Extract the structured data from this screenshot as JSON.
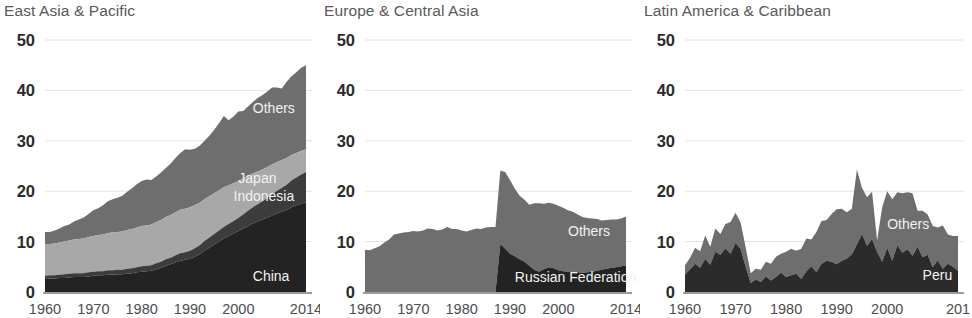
{
  "figure": {
    "background": "#ffffff",
    "width": 958,
    "height": 318
  },
  "palette": {
    "band_dark": "#232323",
    "band_dark_medium": "#3c3c3c",
    "band_light": "#a8a8a8",
    "band_medium": "#6e6e6e",
    "gridline": "#e2e2e2",
    "axis": "#7a7a7a",
    "title_text": "#595959",
    "ytick_text": "#2b2b2b",
    "xtick_text": "#4d4d4d",
    "series_label_text": "#f2f2f2"
  },
  "chart_data": [
    {
      "type": "area",
      "title": "East Asia & Pacific",
      "xlabel": "",
      "ylabel": "",
      "xlim": [
        1960,
        2014
      ],
      "ylim": [
        0,
        50
      ],
      "grid": true,
      "stacked": true,
      "legend_position": "inline-annotation",
      "ytick_values": [
        0,
        10,
        20,
        30,
        40,
        50
      ],
      "ytick_labels": [
        "0",
        "10",
        "20",
        "30",
        "40",
        "50"
      ],
      "xtick_values": [
        1960,
        1970,
        1980,
        1990,
        2000,
        2014
      ],
      "xtick_labels": [
        "1960",
        "1970",
        "1980",
        "1990",
        "2000",
        "2014"
      ],
      "x": [
        1960,
        1961,
        1962,
        1963,
        1964,
        1965,
        1966,
        1967,
        1968,
        1969,
        1970,
        1971,
        1972,
        1973,
        1974,
        1975,
        1976,
        1977,
        1978,
        1979,
        1980,
        1981,
        1982,
        1983,
        1984,
        1985,
        1986,
        1987,
        1988,
        1989,
        1990,
        1991,
        1992,
        1993,
        1994,
        1995,
        1996,
        1997,
        1998,
        1999,
        2000,
        2001,
        2002,
        2003,
        2004,
        2005,
        2006,
        2007,
        2008,
        2009,
        2010,
        2011,
        2012,
        2013,
        2014
      ],
      "series": [
        {
          "name": "China",
          "color": "#232323",
          "values": [
            2.6,
            2.7,
            2.7,
            2.8,
            2.8,
            2.9,
            3.0,
            3.0,
            3.0,
            3.1,
            3.2,
            3.3,
            3.3,
            3.4,
            3.4,
            3.5,
            3.5,
            3.6,
            3.7,
            3.9,
            4.0,
            4.1,
            4.2,
            4.5,
            4.8,
            5.2,
            5.5,
            5.9,
            6.2,
            6.4,
            6.6,
            7.0,
            7.5,
            8.2,
            8.8,
            9.4,
            10.0,
            10.6,
            11.1,
            11.6,
            12.1,
            12.6,
            13.1,
            13.6,
            14.0,
            14.4,
            14.8,
            15.2,
            15.6,
            15.9,
            16.3,
            16.8,
            17.2,
            17.5,
            17.8
          ]
        },
        {
          "name": "Indonesia",
          "color": "#3c3c3c",
          "values": [
            0.6,
            0.6,
            0.6,
            0.6,
            0.7,
            0.7,
            0.7,
            0.7,
            0.7,
            0.8,
            0.8,
            0.8,
            0.8,
            0.9,
            0.9,
            0.9,
            0.9,
            1.0,
            1.0,
            1.0,
            1.1,
            1.1,
            1.1,
            1.2,
            1.2,
            1.3,
            1.3,
            1.4,
            1.5,
            1.5,
            1.6,
            1.7,
            1.8,
            1.9,
            2.0,
            2.1,
            2.2,
            2.3,
            2.4,
            2.5,
            2.6,
            2.8,
            3.0,
            3.2,
            3.4,
            3.6,
            3.9,
            4.2,
            4.5,
            4.8,
            5.0,
            5.3,
            5.5,
            5.8,
            6.0
          ]
        },
        {
          "name": "Japan",
          "color": "#a8a8a8",
          "values": [
            6.3,
            6.2,
            6.3,
            6.4,
            6.5,
            6.6,
            6.7,
            6.8,
            6.9,
            7.0,
            7.1,
            7.2,
            7.3,
            7.4,
            7.5,
            7.5,
            7.6,
            7.7,
            7.8,
            7.9,
            8.0,
            8.0,
            8.1,
            8.2,
            8.3,
            8.4,
            8.5,
            8.5,
            8.6,
            8.6,
            8.6,
            8.5,
            8.4,
            8.3,
            8.2,
            8.1,
            8.0,
            7.9,
            7.7,
            7.5,
            7.3,
            7.1,
            6.9,
            6.7,
            6.5,
            6.3,
            6.1,
            5.9,
            5.7,
            5.5,
            5.3,
            5.1,
            4.9,
            4.7,
            4.5
          ]
        },
        {
          "name": "Others",
          "color": "#6e6e6e",
          "values": [
            2.4,
            2.4,
            2.6,
            2.8,
            3.1,
            3.2,
            3.6,
            3.9,
            4.2,
            4.6,
            5.1,
            5.3,
            5.8,
            6.3,
            6.6,
            6.8,
            7.1,
            7.6,
            8.1,
            8.6,
            8.9,
            9.1,
            8.8,
            9.0,
            9.4,
            9.7,
            10.2,
            10.8,
            11.3,
            11.8,
            11.4,
            11.2,
            11.3,
            11.6,
            12.0,
            12.6,
            13.3,
            14.1,
            12.9,
            13.2,
            13.8,
            13.4,
            13.8,
            14.2,
            14.6,
            14.8,
            15.0,
            15.3,
            14.8,
            14.2,
            15.1,
            15.6,
            16.0,
            16.5,
            16.7
          ]
        }
      ],
      "annotations": [
        {
          "text": "Others",
          "x": 2003,
          "y": 35.5,
          "anchor": "start"
        },
        {
          "text": "Japan",
          "x": 2000,
          "y": 21.7,
          "anchor": "start"
        },
        {
          "text": "Indonesia",
          "x": 1999,
          "y": 18.1,
          "anchor": "start"
        },
        {
          "text": "China",
          "x": 2003,
          "y": 2.2,
          "anchor": "start"
        }
      ]
    },
    {
      "type": "area",
      "title": "Europe & Central Asia",
      "xlabel": "",
      "ylabel": "",
      "xlim": [
        1960,
        2014
      ],
      "ylim": [
        0,
        50
      ],
      "grid": true,
      "stacked": true,
      "legend_position": "inline-annotation",
      "ytick_values": [
        0,
        10,
        20,
        30,
        40,
        50
      ],
      "ytick_labels": [
        "0",
        "10",
        "20",
        "30",
        "40",
        "50"
      ],
      "xtick_values": [
        1960,
        1970,
        1980,
        1990,
        2000,
        2014
      ],
      "xtick_labels": [
        "1960",
        "1970",
        "1980",
        "1990",
        "2000",
        "2014"
      ],
      "x": [
        1960,
        1961,
        1962,
        1963,
        1964,
        1965,
        1966,
        1967,
        1968,
        1969,
        1970,
        1971,
        1972,
        1973,
        1974,
        1975,
        1976,
        1977,
        1978,
        1979,
        1980,
        1981,
        1982,
        1983,
        1984,
        1985,
        1986,
        1987,
        1988,
        1989,
        1990,
        1991,
        1992,
        1993,
        1994,
        1995,
        1996,
        1997,
        1998,
        1999,
        2000,
        2001,
        2002,
        2003,
        2004,
        2005,
        2006,
        2007,
        2008,
        2009,
        2010,
        2011,
        2012,
        2013,
        2014
      ],
      "series": [
        {
          "name": "Russian Federation",
          "color": "#232323",
          "values": [
            0,
            0,
            0,
            0,
            0,
            0,
            0,
            0,
            0,
            0,
            0,
            0,
            0,
            0,
            0,
            0,
            0,
            0,
            0,
            0,
            0,
            0,
            0,
            0,
            0,
            0,
            0,
            0,
            9.5,
            8.6,
            7.6,
            7.1,
            6.5,
            6.0,
            5.2,
            4.4,
            4.0,
            4.5,
            4.9,
            4.7,
            4.3,
            4.1,
            4.0,
            4.0,
            3.9,
            3.8,
            3.9,
            4.0,
            4.2,
            4.4,
            4.6,
            4.8,
            4.9,
            5.1,
            5.2
          ]
        },
        {
          "name": "Others",
          "color": "#6e6e6e",
          "values": [
            8.4,
            8.3,
            8.7,
            9.1,
            9.8,
            10.4,
            11.4,
            11.6,
            11.8,
            11.9,
            12.1,
            12.0,
            12.2,
            12.6,
            12.5,
            12.2,
            12.4,
            12.9,
            12.5,
            12.5,
            12.2,
            12.0,
            12.3,
            12.6,
            12.5,
            12.8,
            12.9,
            12.9,
            14.6,
            15.2,
            14.6,
            13.4,
            12.6,
            12.3,
            12.1,
            13.2,
            13.6,
            13.0,
            12.8,
            12.8,
            12.8,
            12.6,
            12.2,
            11.9,
            11.5,
            11.1,
            10.8,
            10.6,
            10.3,
            9.8,
            9.7,
            9.6,
            9.5,
            9.5,
            9.8
          ]
        }
      ],
      "annotations": [
        {
          "text": "Others",
          "x": 2002,
          "y": 11.2,
          "anchor": "start"
        },
        {
          "text": "Russian Federation",
          "x": 1991,
          "y": 1.9,
          "anchor": "start"
        }
      ]
    },
    {
      "type": "area",
      "title": "Latin America & Caribbean",
      "xlabel": "",
      "ylabel": "",
      "xlim": [
        1960,
        2014
      ],
      "ylim": [
        0,
        50
      ],
      "grid": true,
      "stacked": true,
      "legend_position": "inline-annotation",
      "ytick_values": [
        0,
        10,
        20,
        30,
        40,
        50
      ],
      "ytick_labels": [
        "0",
        "10",
        "20",
        "30",
        "40",
        "50"
      ],
      "xtick_values": [
        1960,
        1970,
        1980,
        1990,
        2000,
        2014
      ],
      "xtick_labels": [
        "1960",
        "1970",
        "1980",
        "1990",
        "2000",
        "201"
      ],
      "x": [
        1960,
        1961,
        1962,
        1963,
        1964,
        1965,
        1966,
        1967,
        1968,
        1969,
        1970,
        1971,
        1972,
        1973,
        1974,
        1975,
        1976,
        1977,
        1978,
        1979,
        1980,
        1981,
        1982,
        1983,
        1984,
        1985,
        1986,
        1987,
        1988,
        1989,
        1990,
        1991,
        1992,
        1993,
        1994,
        1995,
        1996,
        1997,
        1998,
        1999,
        2000,
        2001,
        2002,
        2003,
        2004,
        2005,
        2006,
        2007,
        2008,
        2009,
        2010,
        2011,
        2012,
        2013,
        2014
      ],
      "series": [
        {
          "name": "Peru",
          "color": "#2b2b2b",
          "values": [
            3.4,
            4.5,
            5.6,
            4.8,
            6.6,
            5.4,
            8.0,
            7.4,
            8.7,
            7.6,
            9.7,
            8.6,
            5.0,
            1.8,
            2.5,
            2.0,
            3.1,
            2.3,
            3.0,
            3.8,
            3.0,
            3.3,
            3.6,
            2.6,
            4.1,
            5.1,
            3.9,
            5.6,
            6.2,
            6.0,
            5.5,
            6.2,
            6.6,
            7.5,
            9.4,
            11.5,
            9.2,
            10.5,
            8.0,
            6.0,
            8.8,
            6.2,
            9.3,
            7.8,
            8.5,
            7.2,
            9.0,
            6.9,
            7.4,
            4.9,
            6.3,
            4.6,
            5.6,
            5.0,
            4.2
          ]
        },
        {
          "name": "Others",
          "color": "#6e6e6e",
          "values": [
            1.9,
            2.3,
            3.2,
            3.3,
            4.6,
            3.6,
            4.6,
            4.1,
            4.8,
            6.3,
            6.0,
            5.2,
            3.9,
            1.9,
            2.1,
            2.4,
            2.9,
            3.3,
            4.0,
            3.8,
            5.0,
            5.3,
            4.6,
            6.0,
            6.5,
            5.3,
            8.0,
            8.5,
            8.1,
            9.5,
            10.9,
            10.3,
            9.2,
            9.0,
            14.9,
            9.2,
            9.6,
            9.4,
            2.2,
            10.8,
            11.2,
            12.2,
            10.5,
            11.8,
            11.3,
            12.4,
            7.1,
            9.2,
            8.0,
            8.2,
            6.5,
            8.6,
            5.8,
            6.1,
            6.9
          ]
        }
      ],
      "annotations": [
        {
          "text": "Others",
          "x": 2000,
          "y": 12.5,
          "anchor": "start"
        },
        {
          "text": "Peru",
          "x": 2007,
          "y": 2.4,
          "anchor": "start"
        }
      ]
    }
  ],
  "panels": [
    {
      "left": 0,
      "plot_left": 45,
      "plot_right": 306,
      "title_left": 4
    },
    {
      "left": 320,
      "plot_left": 45,
      "plot_right": 306,
      "title_left": 4
    },
    {
      "left": 640,
      "plot_left": 45,
      "plot_right": 318,
      "title_left": 4
    }
  ],
  "geometry": {
    "plot_top": 40,
    "plot_bottom": 292,
    "xtick_baseline": 310
  }
}
